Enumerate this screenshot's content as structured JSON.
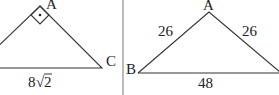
{
  "figure_left": {
    "vertices": {
      "A": {
        "label": "A",
        "x": 40,
        "y": 4
      },
      "C": {
        "label": "C",
        "x": 102,
        "y": 68
      },
      "left_end": {
        "x": 0,
        "y": 68
      }
    },
    "right_angle_at": "A",
    "right_angle_marker": "square-with-dot",
    "base_label": "8√2",
    "base_label_parts": {
      "coef": "8",
      "radical": "√",
      "radicand": "2"
    }
  },
  "divider": {
    "x": 123
  },
  "figure_right": {
    "vertices": {
      "A": {
        "label": "A",
        "x": 209,
        "y": 12
      },
      "B": {
        "label": "B",
        "x": 138,
        "y": 73
      },
      "right_end": {
        "x": 279,
        "y": 73
      }
    },
    "side_labels": {
      "AB": "26",
      "AC": "26",
      "BC": "48"
    }
  },
  "colors": {
    "stroke": "#333333",
    "text": "#222222",
    "divider": "#777777",
    "background": "#ffffff"
  }
}
